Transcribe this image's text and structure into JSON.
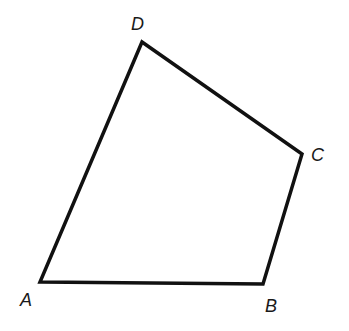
{
  "diagram": {
    "type": "quadrilateral",
    "stroke_color": "#111111",
    "background": "#ffffff",
    "vertices": [
      {
        "label": "A",
        "x": 40,
        "y": 282,
        "label_x": 20,
        "label_y": 306
      },
      {
        "label": "B",
        "x": 263,
        "y": 284,
        "label_x": 265,
        "label_y": 312
      },
      {
        "label": "C",
        "x": 302,
        "y": 154,
        "label_x": 311,
        "label_y": 161
      },
      {
        "label": "D",
        "x": 142,
        "y": 42,
        "label_x": 131,
        "label_y": 30
      }
    ],
    "edges": [
      "AB",
      "BC",
      "CD",
      "DA"
    ]
  }
}
